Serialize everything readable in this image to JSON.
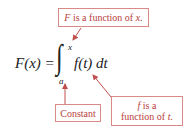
{
  "equation": {
    "lhs": "F(x) =",
    "integral_sign": "∫",
    "upper_limit": "x",
    "lower_limit": "a",
    "integrand": "f(t) dt"
  },
  "annotations": {
    "top": {
      "var": "F",
      "text": " is a function of ",
      "arg": "x."
    },
    "constant": {
      "text": "Constant"
    },
    "right": {
      "var": "f",
      "line1": " is a",
      "line2": "function of ",
      "arg": "t."
    }
  },
  "colors": {
    "annotation_text": "#b8413d",
    "annotation_border": "#d98a86",
    "arrow": "#c0504d",
    "equation": "#222222"
  }
}
